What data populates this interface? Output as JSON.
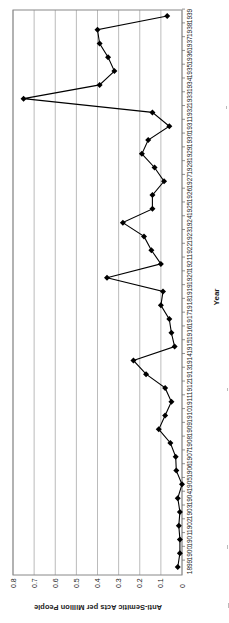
{
  "chart_data": {
    "type": "line",
    "title": "",
    "xlabel": "Year",
    "ylabel": "Anti-Semitic Acts per Million People",
    "ylim": [
      0,
      0.8
    ],
    "yticks": [
      "0",
      "0.1",
      "0.2",
      "0.3",
      "0.4",
      "0.5",
      "0.6",
      "0.7",
      "0.8"
    ],
    "grid": true,
    "legend": "none",
    "orientation": "rotated 90 degrees clockwise on page",
    "x": [
      "1899",
      "1900",
      "1901",
      "1902",
      "1903",
      "1904",
      "1905",
      "1906",
      "1907",
      "1908",
      "1909",
      "1910",
      "1911",
      "1912",
      "1913",
      "1914",
      "1915",
      "1916",
      "1917",
      "1918",
      "1919",
      "1920",
      "1921",
      "1922",
      "1923",
      "1924",
      "1925",
      "1926",
      "1927",
      "1928",
      "1929",
      "1930",
      "1931",
      "1932",
      "1933",
      "1934",
      "1935",
      "1936",
      "1937",
      "1938",
      "1939"
    ],
    "series": [
      {
        "name": "Anti-Semitic Acts per Million People",
        "color": "#000000",
        "marker": "diamond",
        "values": [
          0.02,
          0.01,
          0.01,
          0.015,
          0.01,
          0.02,
          0.0,
          0.027,
          0.03,
          0.055,
          0.11,
          0.08,
          0.05,
          0.08,
          0.17,
          0.23,
          0.035,
          0.05,
          0.06,
          0.1,
          0.09,
          0.355,
          0.1,
          0.145,
          0.18,
          0.28,
          0.14,
          0.14,
          0.085,
          0.13,
          0.19,
          0.16,
          0.06,
          0.14,
          0.75,
          0.39,
          0.32,
          0.35,
          0.39,
          0.4,
          0.07
        ]
      }
    ]
  }
}
